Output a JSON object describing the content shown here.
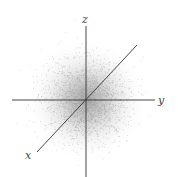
{
  "diagram": {
    "type": "3d-gaussian-point-cloud",
    "axes": {
      "x_label": "x",
      "y_label": "y",
      "z_label": "z"
    },
    "colors": {
      "axis": "#333333",
      "points": "#9a9a9a",
      "label": "#444444"
    }
  }
}
